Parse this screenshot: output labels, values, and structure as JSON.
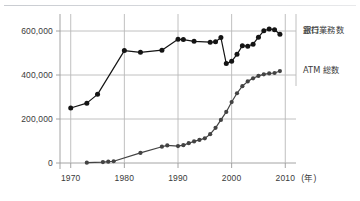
{
  "figure": {
    "background_color": "#ffffff",
    "rule_color": "#c9ccd1",
    "axis_color": "#9a9a9a",
    "grid_color": "#b9b9b9",
    "text_color": "#3a3a3a"
  },
  "axes": {
    "x_unit_label": "(年)",
    "x_ticks": [
      "1970",
      "1980",
      "1990",
      "2000",
      "2010"
    ],
    "y_ticks": [
      "0",
      "200,000",
      "400,000",
      "600,000"
    ]
  },
  "legend": {
    "bank": {
      "line1": "銀行",
      "line2": "窓口業務数",
      "color": "#141414"
    },
    "atm": {
      "line1": "ATM 総数",
      "color": "#434343"
    }
  },
  "chart_data": {
    "type": "line",
    "title": "",
    "xlabel": "(年)",
    "ylabel": "",
    "xlim": [
      1968,
      2012
    ],
    "ylim": [
      0,
      650000
    ],
    "y_ticks": [
      0,
      200000,
      400000,
      600000
    ],
    "x_ticks": [
      1970,
      1980,
      1990,
      2000,
      2010
    ],
    "grid": true,
    "legend_position": "right",
    "series": [
      {
        "name": "銀行窓口業務数",
        "color": "#141414",
        "marker": "filled-circle",
        "points": [
          {
            "x": 1970,
            "y": 250000
          },
          {
            "x": 1973,
            "y": 272000
          },
          {
            "x": 1975,
            "y": 312000
          },
          {
            "x": 1980,
            "y": 511000
          },
          {
            "x": 1983,
            "y": 503000
          },
          {
            "x": 1987,
            "y": 513000
          },
          {
            "x": 1990,
            "y": 562000
          },
          {
            "x": 1991,
            "y": 561000
          },
          {
            "x": 1993,
            "y": 553000
          },
          {
            "x": 1996,
            "y": 549000
          },
          {
            "x": 1997,
            "y": 551000
          },
          {
            "x": 1998,
            "y": 570000
          },
          {
            "x": 1999,
            "y": 452000
          },
          {
            "x": 2000,
            "y": 462000
          },
          {
            "x": 2001,
            "y": 494000
          },
          {
            "x": 2002,
            "y": 533000
          },
          {
            "x": 2003,
            "y": 531000
          },
          {
            "x": 2004,
            "y": 540000
          },
          {
            "x": 2005,
            "y": 572000
          },
          {
            "x": 2006,
            "y": 601000
          },
          {
            "x": 2007,
            "y": 609000
          },
          {
            "x": 2008,
            "y": 606000
          },
          {
            "x": 2009,
            "y": 585000
          }
        ]
      },
      {
        "name": "ATM 総数",
        "color": "#434343",
        "marker": "filled-circle",
        "points": [
          {
            "x": 1973,
            "y": 1500
          },
          {
            "x": 1976,
            "y": 4000
          },
          {
            "x": 1977,
            "y": 6000
          },
          {
            "x": 1978,
            "y": 8000
          },
          {
            "x": 1983,
            "y": 46000
          },
          {
            "x": 1987,
            "y": 74000
          },
          {
            "x": 1988,
            "y": 80000
          },
          {
            "x": 1990,
            "y": 77000
          },
          {
            "x": 1991,
            "y": 81000
          },
          {
            "x": 1992,
            "y": 90000
          },
          {
            "x": 1993,
            "y": 98000
          },
          {
            "x": 1994,
            "y": 105000
          },
          {
            "x": 1995,
            "y": 112000
          },
          {
            "x": 1996,
            "y": 131000
          },
          {
            "x": 1997,
            "y": 160000
          },
          {
            "x": 1998,
            "y": 196000
          },
          {
            "x": 1999,
            "y": 232000
          },
          {
            "x": 2000,
            "y": 277000
          },
          {
            "x": 2001,
            "y": 317000
          },
          {
            "x": 2002,
            "y": 349000
          },
          {
            "x": 2003,
            "y": 371000
          },
          {
            "x": 2004,
            "y": 385000
          },
          {
            "x": 2005,
            "y": 396000
          },
          {
            "x": 2006,
            "y": 403000
          },
          {
            "x": 2007,
            "y": 407000
          },
          {
            "x": 2008,
            "y": 409000
          },
          {
            "x": 2009,
            "y": 418000
          }
        ]
      }
    ]
  }
}
